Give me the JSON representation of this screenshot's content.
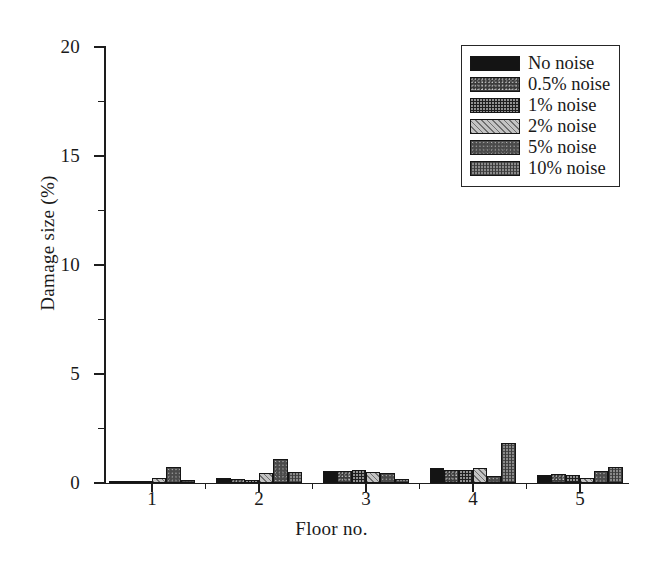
{
  "chart_data": {
    "type": "bar",
    "title": "",
    "xlabel": "Floor no.",
    "ylabel": "Damage size (%)",
    "categories": [
      "1",
      "2",
      "3",
      "4",
      "5"
    ],
    "xlim": [
      0.55,
      5.45
    ],
    "ylim": [
      0,
      20
    ],
    "ytick_labels": [
      "0",
      "5",
      "10",
      "15",
      "20"
    ],
    "ytick_values": [
      0,
      5,
      10,
      15,
      20
    ],
    "yminor_values": [
      2.5,
      7.5,
      12.5,
      17.5
    ],
    "xtick_labels": [
      "1",
      "2",
      "3",
      "4",
      "5"
    ],
    "grid": false,
    "legend_position": "top-right",
    "series": [
      {
        "name": "No noise",
        "pattern": "solid-black",
        "values": [
          0.1,
          0.22,
          0.55,
          0.7,
          0.38
        ]
      },
      {
        "name": "0.5% noise",
        "pattern": "dark-speckle",
        "values": [
          0.08,
          0.2,
          0.55,
          0.58,
          0.4
        ]
      },
      {
        "name": "1% noise",
        "pattern": "dark-dots",
        "values": [
          0.06,
          0.16,
          0.58,
          0.6,
          0.35
        ]
      },
      {
        "name": "2% noise",
        "pattern": "light-diagonal-hatch",
        "values": [
          0.22,
          0.48,
          0.52,
          0.68,
          0.22
        ]
      },
      {
        "name": "5% noise",
        "pattern": "dark-gray-speckle",
        "values": [
          0.75,
          1.1,
          0.48,
          0.32,
          0.55
        ]
      },
      {
        "name": "10% noise",
        "pattern": "gray-crosshatch",
        "values": [
          0.12,
          0.5,
          0.18,
          1.85,
          0.72
        ]
      }
    ]
  },
  "legend": {
    "items": [
      {
        "label": "No noise"
      },
      {
        "label": "0.5% noise"
      },
      {
        "label": "1% noise"
      },
      {
        "label": "2% noise"
      },
      {
        "label": "5% noise"
      },
      {
        "label": "10% noise"
      }
    ]
  },
  "axes": {
    "y_title": "Damage size (%)",
    "x_title": "Floor no."
  }
}
